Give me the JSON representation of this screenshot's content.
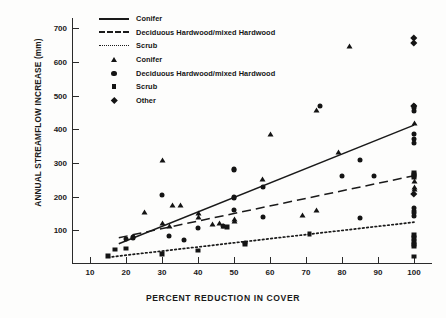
{
  "chart_data": {
    "type": "scatter",
    "title": "",
    "xlabel": "PERCENT REDUCTION IN COVER",
    "ylabel": "ANNUAL STREAMFLOW INCREASE (mm)",
    "xlim": [
      5,
      105
    ],
    "ylim": [
      0,
      730
    ],
    "xticks": [
      10,
      20,
      30,
      40,
      50,
      60,
      70,
      80,
      90,
      100
    ],
    "yticks": [
      100,
      200,
      300,
      400,
      500,
      600,
      700
    ],
    "grid": false,
    "legend_position": "top-left-inside",
    "legend": [
      {
        "label": "Conifer",
        "key": "solid-line"
      },
      {
        "label": "Deciduous Hardwood/mixed Hardwood",
        "key": "dashed-line"
      },
      {
        "label": "Scrub",
        "key": "dotted-line"
      },
      {
        "label": "Conifer",
        "key": "triangle-marker"
      },
      {
        "label": "Deciduous Hardwood/mixed Hardwood",
        "key": "circle-marker"
      },
      {
        "label": "Scrub",
        "key": "square-marker"
      },
      {
        "label": "Other",
        "key": "diamond-marker"
      }
    ],
    "series": [
      {
        "name": "Conifer",
        "marker": "triangle",
        "line": "solid",
        "fit_line": {
          "x": [
            18,
            100
          ],
          "y": [
            60,
            412
          ]
        },
        "points": [
          [
            25,
            155
          ],
          [
            30,
            310
          ],
          [
            30,
            122
          ],
          [
            32,
            113
          ],
          [
            33,
            175
          ],
          [
            35,
            176
          ],
          [
            40,
            152
          ],
          [
            40,
            138
          ],
          [
            44,
            118
          ],
          [
            46,
            122
          ],
          [
            47,
            112
          ],
          [
            50,
            133
          ],
          [
            50,
            128
          ],
          [
            58,
            252
          ],
          [
            60,
            385
          ],
          [
            69,
            145
          ],
          [
            73,
            160
          ],
          [
            73,
            458
          ],
          [
            79,
            332
          ],
          [
            82,
            648
          ],
          [
            100,
            418
          ],
          [
            100,
            245
          ],
          [
            100,
            228
          ],
          [
            100,
            222
          ]
        ]
      },
      {
        "name": "Deciduous Hardwood/mixed Hardwood",
        "marker": "circle",
        "line": "dashed",
        "fit_line": {
          "x": [
            18,
            100
          ],
          "y": [
            78,
            262
          ]
        },
        "points": [
          [
            20,
            75
          ],
          [
            22,
            79
          ],
          [
            22,
            76
          ],
          [
            30,
            205
          ],
          [
            32,
            84
          ],
          [
            36,
            71
          ],
          [
            40,
            108
          ],
          [
            47,
            112
          ],
          [
            50,
            282
          ],
          [
            50,
            278
          ],
          [
            50,
            200
          ],
          [
            50,
            196
          ],
          [
            50,
            160
          ],
          [
            53,
            62
          ],
          [
            58,
            228
          ],
          [
            58,
            140
          ],
          [
            74,
            470
          ],
          [
            80,
            260
          ],
          [
            85,
            308
          ],
          [
            85,
            137
          ],
          [
            89,
            262
          ],
          [
            100,
            470
          ],
          [
            100,
            462
          ],
          [
            100,
            455
          ],
          [
            100,
            385
          ],
          [
            100,
            372
          ],
          [
            100,
            360
          ],
          [
            100,
            165
          ],
          [
            100,
            158
          ],
          [
            100,
            152
          ],
          [
            100,
            142
          ]
        ]
      },
      {
        "name": "Scrub",
        "marker": "square",
        "line": "dotted",
        "fit_line": {
          "x": [
            15,
            100
          ],
          "y": [
            20,
            124
          ]
        },
        "points": [
          [
            15,
            24
          ],
          [
            17,
            43
          ],
          [
            20,
            46
          ],
          [
            30,
            30
          ],
          [
            40,
            40
          ],
          [
            48,
            110
          ],
          [
            53,
            60
          ],
          [
            71,
            88
          ],
          [
            100,
            270
          ],
          [
            100,
            265
          ],
          [
            100,
            258
          ],
          [
            100,
            86
          ],
          [
            100,
            78
          ],
          [
            100,
            66
          ],
          [
            100,
            58
          ],
          [
            100,
            52
          ],
          [
            100,
            22
          ]
        ]
      },
      {
        "name": "Other",
        "marker": "diamond",
        "line": "none",
        "points": [
          [
            100,
            672
          ],
          [
            100,
            656
          ],
          [
            100,
            468
          ],
          [
            100,
            208
          ]
        ]
      }
    ]
  }
}
